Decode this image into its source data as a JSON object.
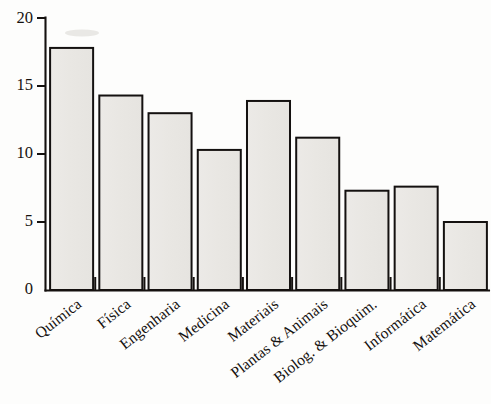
{
  "chart_data": {
    "type": "bar",
    "title": "",
    "subtitle": "",
    "xlabel": "",
    "ylabel": "",
    "categories": [
      "Química",
      "Física",
      "Engenharia",
      "Medicina",
      "Materiais",
      "Plantas & Animais",
      "Biolog. & Bioquim.",
      "Informática",
      "Matemática"
    ],
    "values": [
      17.8,
      14.3,
      13.0,
      10.3,
      13.9,
      11.2,
      7.3,
      7.6,
      5.0
    ],
    "ylim": [
      0,
      20
    ],
    "yticks": [
      0,
      5,
      10,
      15,
      20
    ],
    "ytick_labels": [
      "0",
      "5",
      "10",
      "15",
      "20"
    ],
    "xtick_label_rotation_deg": 38,
    "grid": false,
    "legend": null,
    "legend_position": "none",
    "bar_fill_color": "#e9e8e5",
    "bar_edge_color": "#141110",
    "axis_color": "#15110f",
    "background_color": "#fdfdfc",
    "annotations": []
  },
  "axes": {
    "y_axis_name": "y-axis",
    "x_axis_name": "x-axis"
  }
}
